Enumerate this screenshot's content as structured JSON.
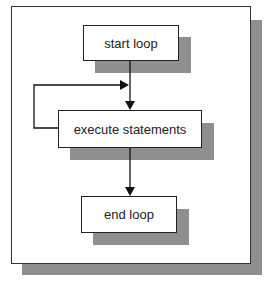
{
  "diagram": {
    "type": "flowchart",
    "nodes": [
      {
        "id": "start",
        "label": "start loop"
      },
      {
        "id": "exec",
        "label": "execute statements"
      },
      {
        "id": "end",
        "label": "end loop"
      }
    ],
    "edges": [
      {
        "from": "start",
        "to": "exec"
      },
      {
        "from": "exec",
        "to": "exec",
        "kind": "loop-back"
      },
      {
        "from": "exec",
        "to": "end"
      }
    ],
    "colors": {
      "shadow": "#8f8f8f",
      "stroke": "#222222",
      "background": "#ffffff"
    }
  }
}
